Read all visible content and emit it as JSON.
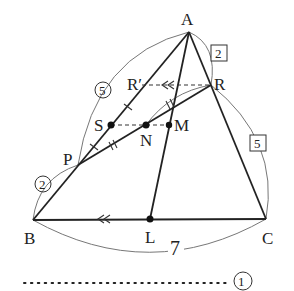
{
  "diagram": {
    "points": {
      "A": {
        "label": "A",
        "x": 189,
        "y": 32
      },
      "B": {
        "label": "B",
        "x": 33,
        "y": 220
      },
      "C": {
        "label": "C",
        "x": 266,
        "y": 219
      },
      "R": {
        "label": "R",
        "x": 211,
        "y": 85
      },
      "R_prime": {
        "label": "R′",
        "x": 142,
        "y": 85
      },
      "S": {
        "label": "S",
        "x": 111,
        "y": 125
      },
      "N": {
        "label": "N",
        "x": 146,
        "y": 125
      },
      "M": {
        "label": "M",
        "x": 169,
        "y": 125
      },
      "P": {
        "label": "P",
        "x": 78,
        "y": 165
      },
      "L": {
        "label": "L",
        "x": 150,
        "y": 219
      }
    },
    "ratio_labels": {
      "AP": "5",
      "PB": "2",
      "AR": "2",
      "RC": "5",
      "BC": "7"
    },
    "footer": {
      "circled_number": "1",
      "dots": "・・・・・・・・・・・・・・・・・・・・・・・・・・・・・"
    }
  }
}
